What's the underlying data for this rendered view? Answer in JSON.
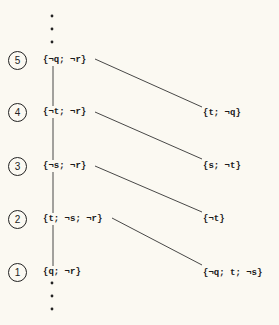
{
  "diagram": {
    "nodes_left": [
      {
        "index": "5",
        "label": "{¬q; ¬r}",
        "y": 60
      },
      {
        "index": "4",
        "label": "{¬t; ¬r}",
        "y": 112
      },
      {
        "index": "3",
        "label": "{¬s; ¬r}",
        "y": 166
      },
      {
        "index": "2",
        "label": "{t; ¬s; ¬r}",
        "y": 219
      },
      {
        "index": "1",
        "label": "{q; ¬r}",
        "y": 272
      }
    ],
    "nodes_right": [
      {
        "label": "{t; ¬q}",
        "y": 113
      },
      {
        "label": "{s; ¬t}",
        "y": 166
      },
      {
        "label": "{¬t}",
        "y": 219
      },
      {
        "label": "{¬q; t; ¬s}",
        "y": 273
      }
    ],
    "edges": [
      {
        "from": "5",
        "to": "{t; ¬q}"
      },
      {
        "from": "4",
        "to": "{s; ¬t}"
      },
      {
        "from": "3",
        "to": "{¬t}"
      },
      {
        "from": "2",
        "to": "{¬q; t; ¬s}"
      }
    ],
    "ellipsis_top": "⋮",
    "ellipsis_bottom": "⋮",
    "colors": {
      "background": "#fbf9f2",
      "ink": "#222222"
    }
  }
}
